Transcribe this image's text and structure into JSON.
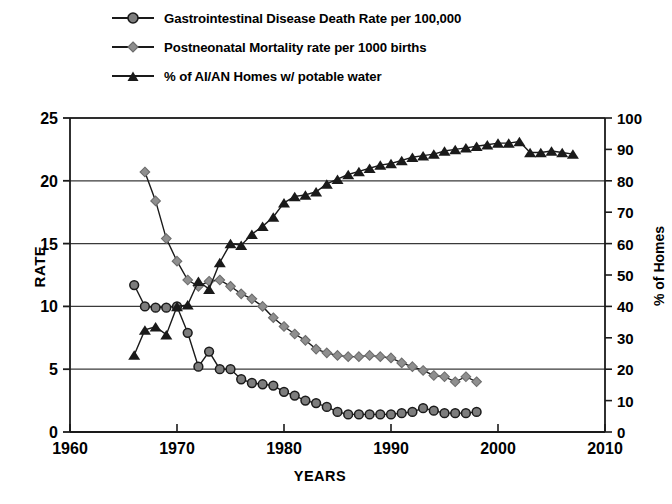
{
  "chart_data": {
    "type": "line",
    "title": "",
    "xlabel": "YEARS",
    "ylabel": "RATE",
    "ylabel_secondary": "% of Homes",
    "xlim": [
      1960,
      2010
    ],
    "ylim": [
      0,
      25
    ],
    "ylim_secondary": [
      0,
      100
    ],
    "xticks": [
      1960,
      1970,
      1980,
      1990,
      2000,
      2010
    ],
    "yticks": [
      0,
      5,
      10,
      15,
      20,
      25
    ],
    "yticks_secondary": [
      0,
      10,
      20,
      30,
      40,
      50,
      60,
      70,
      80,
      90,
      100
    ],
    "grid": "horizontal-major",
    "legend_position": "top-left",
    "series": [
      {
        "name": "Gastrointestinal Disease Death Rate per 100,000",
        "axis": "left",
        "marker": "circle",
        "color": "#7d7d7d",
        "x": [
          1966,
          1967,
          1968,
          1969,
          1970,
          1971,
          1972,
          1973,
          1974,
          1975,
          1976,
          1977,
          1978,
          1979,
          1980,
          1981,
          1982,
          1983,
          1984,
          1985,
          1986,
          1987,
          1988,
          1989,
          1990,
          1991,
          1992,
          1993,
          1994,
          1995,
          1996,
          1997,
          1998
        ],
        "values": [
          11.7,
          10.0,
          9.9,
          9.9,
          10.0,
          7.9,
          5.2,
          6.4,
          5.0,
          5.0,
          4.2,
          3.9,
          3.8,
          3.7,
          3.2,
          2.9,
          2.5,
          2.3,
          2.0,
          1.6,
          1.4,
          1.4,
          1.4,
          1.4,
          1.4,
          1.5,
          1.6,
          1.9,
          1.7,
          1.5,
          1.5,
          1.5,
          1.6
        ]
      },
      {
        "name": "Postneonatal Mortality rate per 1000 births",
        "axis": "left",
        "marker": "diamond",
        "color": "#8f8f8f",
        "x": [
          1967,
          1968,
          1969,
          1970,
          1971,
          1972,
          1973,
          1974,
          1975,
          1976,
          1977,
          1978,
          1979,
          1980,
          1981,
          1982,
          1983,
          1984,
          1985,
          1986,
          1987,
          1988,
          1989,
          1990,
          1991,
          1992,
          1993,
          1994,
          1995,
          1996,
          1997,
          1998
        ],
        "values": [
          20.7,
          18.4,
          15.4,
          13.6,
          12.1,
          11.6,
          12.0,
          12.1,
          11.6,
          11.0,
          10.6,
          10.0,
          9.1,
          8.4,
          7.8,
          7.3,
          6.6,
          6.3,
          6.1,
          6.0,
          6.0,
          6.1,
          6.0,
          5.9,
          5.5,
          5.2,
          4.9,
          4.5,
          4.4,
          4.0,
          4.4,
          4.0
        ]
      },
      {
        "name": "% of AI/AN Homes w/ potable water",
        "axis": "right",
        "marker": "triangle",
        "color": "#1a1a1a",
        "x": [
          1966,
          1967,
          1968,
          1969,
          1970,
          1971,
          1972,
          1973,
          1974,
          1975,
          1976,
          1977,
          1978,
          1979,
          1980,
          1981,
          1982,
          1983,
          1984,
          1985,
          1986,
          1987,
          1988,
          1989,
          1990,
          1991,
          1992,
          1993,
          1994,
          1995,
          1996,
          1997,
          1998,
          1999,
          2000,
          2001,
          2002,
          2003,
          2004,
          2005,
          2006,
          2007
        ],
        "values": [
          24.5,
          32.5,
          33.5,
          31.0,
          40.0,
          40.5,
          48.0,
          45.5,
          54.0,
          60.0,
          59.5,
          63.0,
          65.5,
          68.5,
          73.0,
          75.0,
          75.5,
          76.5,
          79.0,
          80.5,
          82.0,
          83.0,
          84.0,
          85.0,
          85.5,
          86.5,
          87.5,
          88.0,
          88.5,
          89.5,
          90.0,
          90.5,
          91.0,
          91.5,
          92.0,
          92.0,
          92.5,
          89.0,
          89.0,
          89.5,
          89.0,
          88.5
        ]
      }
    ]
  },
  "legend": {
    "items": [
      {
        "label": "Gastrointestinal Disease Death Rate per 100,000",
        "marker": "circle-marker"
      },
      {
        "label": "Postneonatal Mortality rate per 1000 births",
        "marker": "diamond-marker"
      },
      {
        "label": "% of AI/AN Homes w/ potable water",
        "marker": "triangle-marker"
      }
    ]
  },
  "axes": {
    "left_title": "RATE",
    "right_title": "% of Homes",
    "bottom_title": "YEARS"
  }
}
